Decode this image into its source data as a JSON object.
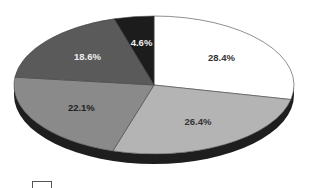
{
  "chart_data": {
    "type": "pie",
    "style": "3d",
    "title": "",
    "start_angle": "12 o'clock",
    "direction": "clockwise",
    "slices": [
      {
        "label": "28.4%",
        "value": 28.4,
        "color": "#ffffff",
        "label_color": "#333333"
      },
      {
        "label": "26.4%",
        "value": 26.4,
        "color": "#b4b4b4",
        "label_color": "#333333"
      },
      {
        "label": "22.1%",
        "value": 22.1,
        "color": "#8a8a8a",
        "label_color": "#222222"
      },
      {
        "label": "18.6%",
        "value": 18.6,
        "color": "#5a5a5a",
        "label_color": "#eeeeee"
      },
      {
        "label": "4.6%",
        "value": 4.6,
        "color": "#1c1c1c",
        "label_color": "#eeeeee"
      }
    ],
    "legend": {
      "visible": true,
      "position": "bottom-left",
      "entries": []
    }
  }
}
